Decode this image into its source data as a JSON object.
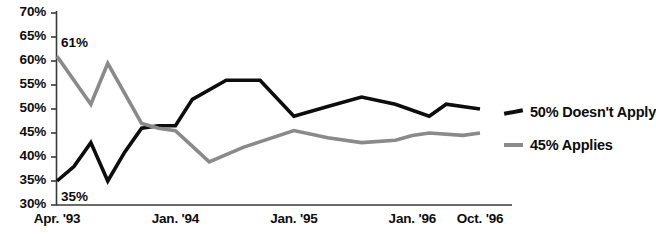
{
  "chart_data": {
    "type": "line",
    "title": "",
    "subtitle": "",
    "xlabel": "",
    "ylabel": "",
    "ylim": [
      30,
      70
    ],
    "ytick_step": 5,
    "grid": false,
    "legend_position": "right-of-plot",
    "ytick_labels": [
      "70%",
      "65%",
      "60%",
      "55%",
      "50%",
      "45%",
      "40%",
      "35%",
      "30%"
    ],
    "ytick_values": [
      70,
      65,
      60,
      55,
      50,
      45,
      40,
      35,
      30
    ],
    "xtick_labels": [
      "Apr. '93",
      "Jan. '94",
      "Jan. '95",
      "Jan. '96",
      "Oct. '96"
    ],
    "xtick_positions": [
      0,
      7,
      14,
      21,
      25
    ],
    "x_index_range": [
      0,
      25
    ],
    "annotations": [
      {
        "text": "61%",
        "x": 0,
        "y": 61,
        "series": "Applies",
        "placement": "above-right"
      },
      {
        "text": "35%",
        "x": 0,
        "y": 35,
        "series": "Doesn't Apply",
        "placement": "below-right"
      }
    ],
    "series": [
      {
        "name": "Doesn't Apply",
        "legend_label": "50% Doesn't Apply",
        "end_value": 50,
        "color": "#0d0d0d",
        "x": [
          0,
          1,
          2,
          3,
          4,
          5,
          6,
          7,
          8,
          10,
          12,
          14,
          16,
          18,
          20,
          22,
          23,
          25
        ],
        "values": [
          35,
          38,
          43,
          35,
          41,
          46,
          46.5,
          46.5,
          52,
          56,
          56,
          48.5,
          50.5,
          52.5,
          51,
          48.5,
          51,
          50
        ]
      },
      {
        "name": "Applies",
        "legend_label": "45% Applies",
        "end_value": 45,
        "color": "#8a8a8a",
        "x": [
          0,
          2,
          3,
          5,
          6,
          7,
          9,
          11,
          14,
          16,
          18,
          20,
          21,
          22,
          24,
          25
        ],
        "values": [
          61,
          51,
          59.5,
          47,
          46,
          45.5,
          39,
          42,
          45.5,
          44,
          43,
          43.5,
          44.5,
          45,
          44.5,
          45
        ]
      }
    ]
  },
  "legend": {
    "items": [
      {
        "label": "50% Doesn't Apply",
        "color": "#0d0d0d",
        "style": "sloped"
      },
      {
        "label": "45% Applies",
        "color": "#8a8a8a",
        "style": "flat"
      }
    ]
  },
  "axes": {
    "y_axis_color": "#3a3a3a",
    "x_axis_color": "#3a3a3a"
  }
}
